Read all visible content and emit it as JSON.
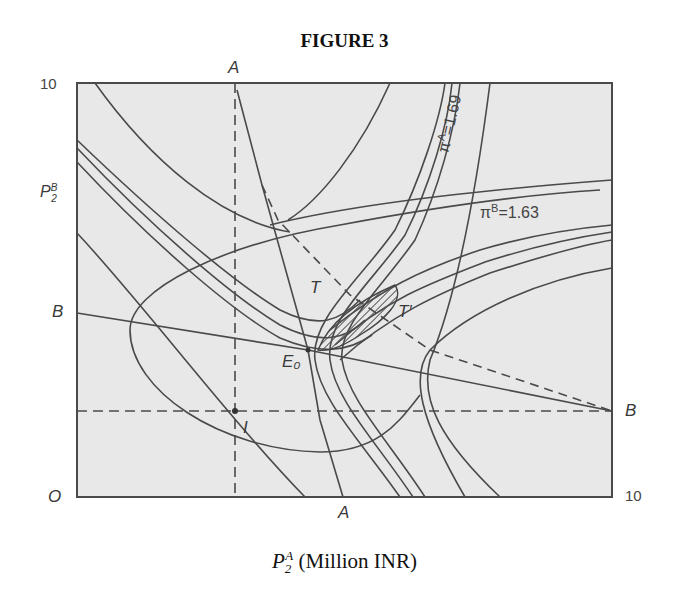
{
  "chart_data": {
    "type": "line",
    "title": "FIGURE 3",
    "xlabel": "P_2^A (Million INR)",
    "xlabel_parts": {
      "base": "P",
      "sub": "2",
      "sup": "A",
      "unit": "(Million INR)"
    },
    "ylabel": "P_2^B",
    "xlim": [
      0,
      10
    ],
    "ylim": [
      0,
      10
    ],
    "grid": false,
    "legend": null,
    "tick_labels": {
      "origin": "O",
      "y_max": "10",
      "x_max": "10"
    },
    "point_labels": {
      "A_top": "A",
      "A_bottom": "A",
      "B_left": "B",
      "B_right": "B",
      "E0": "E₀",
      "I": "I",
      "T": "T",
      "T_prime": "T′"
    },
    "annotations": [
      {
        "text": "π^A=1.69",
        "description": "label on the isoprofit curve family of firm A (rotated vertical)"
      },
      {
        "text": "π^B=1.63",
        "description": "label on the isoprofit curve family of firm B"
      }
    ],
    "series": [
      {
        "name": "Reaction line A (A-A)",
        "style": "solid",
        "x": [
          4.0,
          4.9
        ],
        "y": [
          10,
          0
        ]
      },
      {
        "name": "Reaction line B (B-B)",
        "style": "solid",
        "x": [
          0,
          10
        ],
        "y": [
          4.5,
          2.1
        ]
      },
      {
        "name": "Contract curve T-T' (dashed)",
        "style": "dashed",
        "x": [
          4.0,
          10
        ],
        "y": [
          10,
          2.1
        ]
      },
      {
        "name": "Dashed guide through I (vertical)",
        "style": "dashed",
        "x": [
          2.9,
          2.9
        ],
        "y": [
          10,
          0
        ]
      },
      {
        "name": "Dashed guide through I (horizontal)",
        "style": "dashed",
        "x": [
          0,
          10
        ],
        "y": [
          2.1,
          2.1
        ]
      },
      {
        "name": "Isoprofit π^A = 1.69 (innermost)",
        "style": "solid"
      },
      {
        "name": "Isoprofit π^B = 1.63 (innermost)",
        "style": "solid"
      }
    ],
    "points": {
      "E0": {
        "x": 4.3,
        "y": 3.5
      },
      "I": {
        "x": 2.9,
        "y": 2.1
      },
      "lens_region": {
        "x_range": [
          4.4,
          5.6
        ],
        "y_range": [
          3.6,
          5.4
        ],
        "description": "hatched mutually-beneficial region between T and T'"
      }
    }
  }
}
